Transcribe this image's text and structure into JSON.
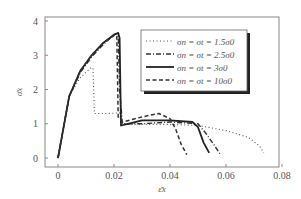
{
  "chart_data": {
    "type": "line",
    "title": "",
    "xlabel": "ε̄x",
    "ylabel": "σ̄x",
    "xlim": [
      0,
      0.08
    ],
    "ylim": [
      0,
      4
    ],
    "xticks": [
      0,
      0.02,
      0.04,
      0.06,
      0.08
    ],
    "xtick_labels": [
      "0",
      "0.02",
      "0.04",
      "0.06",
      "0.08"
    ],
    "yticks": [
      0,
      1,
      2,
      3,
      4
    ],
    "ytick_labels": [
      "0",
      "1",
      "2",
      "3",
      "4"
    ],
    "grid": false,
    "legend_position": "upper right (inside, with drop shadow)",
    "series": [
      {
        "name": "σn = σt = 1.5σ0",
        "style": "dotted",
        "x": [
          0,
          0.004,
          0.008,
          0.012,
          0.0125,
          0.013,
          0.018,
          0.022,
          0.023,
          0.03,
          0.04,
          0.05,
          0.06,
          0.068,
          0.072,
          0.0735
        ],
        "y": [
          0,
          1.8,
          2.35,
          2.65,
          2.6,
          1.3,
          1.3,
          1.32,
          1.0,
          0.98,
          0.98,
          0.95,
          0.8,
          0.6,
          0.35,
          0.15
        ]
      },
      {
        "name": "σn = σt = 2.5σ0",
        "style": "dash-dot",
        "x": [
          0,
          0.004,
          0.008,
          0.012,
          0.016,
          0.02,
          0.0215,
          0.022,
          0.023,
          0.03,
          0.04,
          0.05,
          0.053,
          0.056,
          0.058
        ],
        "y": [
          0,
          1.8,
          2.5,
          2.95,
          3.3,
          3.6,
          3.65,
          2.0,
          1.0,
          1.0,
          1.05,
          1.0,
          0.7,
          0.35,
          0.1
        ]
      },
      {
        "name": "σn = σt = 3σ0",
        "style": "solid",
        "x": [
          0,
          0.004,
          0.008,
          0.012,
          0.016,
          0.02,
          0.0215,
          0.022,
          0.0225,
          0.025,
          0.03,
          0.04,
          0.048,
          0.05,
          0.052,
          0.054
        ],
        "y": [
          0,
          1.8,
          2.55,
          3.0,
          3.35,
          3.6,
          3.65,
          3.5,
          0.95,
          1.0,
          1.1,
          1.1,
          1.05,
          0.9,
          0.45,
          0.15
        ]
      },
      {
        "name": "σn = σt = 10σ0",
        "style": "dashed",
        "x": [
          0,
          0.004,
          0.008,
          0.012,
          0.016,
          0.0205,
          0.021,
          0.0215,
          0.023,
          0.03,
          0.036,
          0.04,
          0.042,
          0.044,
          0.046
        ],
        "y": [
          0,
          1.8,
          2.55,
          3.0,
          3.35,
          3.6,
          3.55,
          1.2,
          1.05,
          1.2,
          1.3,
          1.15,
          0.85,
          0.4,
          0.1
        ]
      }
    ]
  }
}
